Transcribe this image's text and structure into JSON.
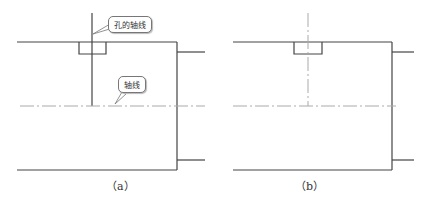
{
  "figures": [
    {
      "id": "a",
      "caption": "（a）",
      "callouts": [
        {
          "label": "孔的轴线"
        },
        {
          "label": "轴线"
        }
      ]
    },
    {
      "id": "b",
      "caption": "（b）"
    }
  ],
  "colors": {
    "outline": "#444444",
    "centerline": "#aaaaaa",
    "callout_border": "#777777"
  }
}
